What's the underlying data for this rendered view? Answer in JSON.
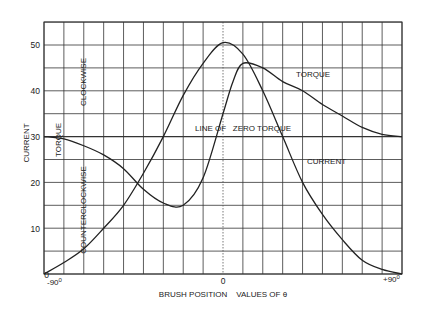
{
  "chart_data": {
    "type": "line",
    "title": "",
    "xlabel": "BRUSH POSITION    VALUES OF θ",
    "ylabel": "CURRENT",
    "xlim": [
      -90,
      90
    ],
    "ylim": [
      0,
      55
    ],
    "grid": true,
    "x_ticks": [
      "-90°",
      "0",
      "+90°"
    ],
    "y_ticks": [
      0,
      10,
      20,
      30,
      40,
      50
    ],
    "series": [
      {
        "name": "CURRENT",
        "x": [
          -90,
          -80,
          -70,
          -60,
          -50,
          -40,
          -30,
          -20,
          -10,
          0,
          10,
          20,
          30,
          40,
          50,
          60,
          70,
          80,
          90
        ],
        "values": [
          0,
          2.5,
          5.5,
          10,
          15,
          22,
          30,
          39,
          46,
          50.5,
          48,
          40,
          30,
          20,
          13,
          7.5,
          3,
          1,
          0
        ]
      },
      {
        "name": "TORQUE",
        "x": [
          -90,
          -80,
          -70,
          -60,
          -50,
          -40,
          -30,
          -20,
          -10,
          0,
          5,
          10,
          20,
          30,
          40,
          50,
          60,
          70,
          80,
          90
        ],
        "values": [
          30,
          29.5,
          28,
          26,
          23,
          18.5,
          15.5,
          15,
          21,
          35,
          42,
          46,
          45,
          42,
          40,
          37,
          34.5,
          32,
          30.5,
          30
        ]
      }
    ],
    "annotations": [
      {
        "text": "CLOCKWISE",
        "orientation": "vertical"
      },
      {
        "text": "COUNTERCLOCKWISE",
        "orientation": "vertical"
      },
      {
        "text": "TORQUE",
        "orientation": "vertical"
      },
      {
        "text": "TORQUE"
      },
      {
        "text": "LINE OF   ZERO TORQUE"
      },
      {
        "text": "CURRENT"
      }
    ],
    "reference_lines": [
      {
        "name": "LINE OF ZERO TORQUE",
        "y": 30,
        "style": "horizontal"
      },
      {
        "name": "theta-zero",
        "x": 0,
        "style": "dotted-vertical"
      }
    ]
  },
  "labels": {
    "ylabel": "CURRENT",
    "xlabel": "BRUSH POSITION    VALUES OF θ",
    "clockwise": "CLOCKWISE",
    "counterclockwise": "COUNTERCLOCKWISE",
    "torque_left": "TORQUE",
    "torque_curve": "TORQUE",
    "zero_line": "LINE OF   ZERO TORQUE",
    "current_curve": "CURRENT",
    "x_min": "-90",
    "x_mid": "0",
    "x_max": "+90",
    "deg": "0",
    "y0": "0",
    "y10": "10",
    "y20": "20",
    "y30": "30",
    "y40": "40",
    "y50": "50"
  }
}
